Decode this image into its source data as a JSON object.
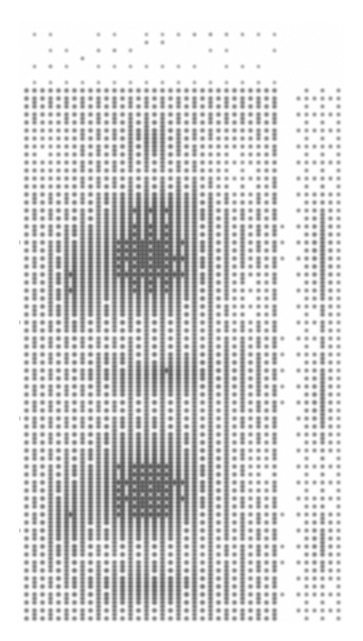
{
  "document": {
    "kind": "dithered-halftone-scan",
    "title": "Dithered halftone scan",
    "caption": "Coarse ordered-dither reproduction of a scanned grayscale image",
    "width": 363,
    "height": 641,
    "background_color": "#ffffff",
    "ink_color": "#6e6e6e",
    "ink_color_light": "#9a9a9a"
  },
  "render": {
    "dither_type": "ordered-diagonal",
    "cell_size": 4,
    "blur_radius": 1.15,
    "ink_min_gray": 96,
    "ink_max_gray": 178,
    "paper_gray": 255,
    "noise_amount": 0.035
  },
  "margins": {
    "left": 20,
    "right": 20,
    "top": 25,
    "bottom": 19
  },
  "regions": [
    {
      "name": "main-block",
      "x": 20,
      "y": 85,
      "width": 262,
      "height": 537,
      "base_tone": 0.34,
      "note": "large left/main textured panel"
    },
    {
      "name": "gutter-column",
      "x": 282,
      "y": 85,
      "width": 10,
      "height": 537,
      "base_tone": 0.02,
      "note": "near-white vertical separator"
    },
    {
      "name": "right-column",
      "x": 292,
      "y": 85,
      "width": 51,
      "height": 537,
      "base_tone": 0.2,
      "note": "narrower lighter right panel"
    },
    {
      "name": "top-arc-band",
      "x": 20,
      "y": 25,
      "width": 260,
      "height": 60,
      "base_tone": 0.06,
      "note": "sparse rising arc of dashes over white"
    }
  ],
  "tone_field": {
    "description": "Additive elliptical tone blobs over the region bases. tone 0 = paper white, 1 = solid ink.",
    "blobs": [
      {
        "name": "upper-dark-mass",
        "cx": 150,
        "cy": 265,
        "rx": 108,
        "ry": 92,
        "amp": 0.4,
        "falloff": 1.6
      },
      {
        "name": "upper-core",
        "cx": 145,
        "cy": 250,
        "rx": 70,
        "ry": 58,
        "amp": 0.26,
        "falloff": 1.8
      },
      {
        "name": "upper-crest",
        "cx": 160,
        "cy": 205,
        "rx": 92,
        "ry": 34,
        "amp": 0.22,
        "falloff": 1.5
      },
      {
        "name": "upper-left-edge",
        "cx": 72,
        "cy": 280,
        "rx": 42,
        "ry": 95,
        "amp": 0.22,
        "falloff": 1.7
      },
      {
        "name": "cross-patch-top",
        "cx": 150,
        "cy": 140,
        "rx": 52,
        "ry": 38,
        "amp": 0.2,
        "falloff": 1.9
      },
      {
        "name": "mid-band",
        "cx": 162,
        "cy": 372,
        "rx": 120,
        "ry": 40,
        "amp": 0.3,
        "falloff": 1.5
      },
      {
        "name": "lower-dark-mass",
        "cx": 150,
        "cy": 480,
        "rx": 110,
        "ry": 98,
        "amp": 0.38,
        "falloff": 1.6
      },
      {
        "name": "lower-core",
        "cx": 140,
        "cy": 500,
        "rx": 72,
        "ry": 62,
        "amp": 0.24,
        "falloff": 1.8
      },
      {
        "name": "lower-left-edge",
        "cx": 66,
        "cy": 520,
        "rx": 40,
        "ry": 80,
        "amp": 0.24,
        "falloff": 1.7
      },
      {
        "name": "bottom-sweep",
        "cx": 150,
        "cy": 585,
        "rx": 118,
        "ry": 34,
        "amp": 0.26,
        "falloff": 1.5
      },
      {
        "name": "right-col-upper",
        "cx": 318,
        "cy": 250,
        "rx": 26,
        "ry": 95,
        "amp": 0.26,
        "falloff": 1.6
      },
      {
        "name": "right-col-mid",
        "cx": 316,
        "cy": 400,
        "rx": 24,
        "ry": 80,
        "amp": 0.22,
        "falloff": 1.6
      },
      {
        "name": "right-col-lower",
        "cx": 318,
        "cy": 545,
        "rx": 26,
        "ry": 70,
        "amp": 0.22,
        "falloff": 1.6
      },
      {
        "name": "right-col-spine",
        "cx": 324,
        "cy": 350,
        "rx": 9,
        "ry": 240,
        "amp": 0.16,
        "falloff": 1.4
      }
    ],
    "voids": [
      {
        "name": "upper-right-light",
        "cx": 238,
        "cy": 170,
        "rx": 54,
        "ry": 62,
        "amp": 0.18,
        "falloff": 1.6
      },
      {
        "name": "mid-right-light",
        "cx": 250,
        "cy": 300,
        "rx": 44,
        "ry": 58,
        "amp": 0.14,
        "falloff": 1.6
      },
      {
        "name": "upper-left-light",
        "cx": 46,
        "cy": 150,
        "rx": 40,
        "ry": 58,
        "amp": 0.14,
        "falloff": 1.6
      },
      {
        "name": "seam-light",
        "cx": 150,
        "cy": 360,
        "rx": 58,
        "ry": 16,
        "amp": 0.1,
        "falloff": 1.5
      },
      {
        "name": "lower-right-light",
        "cx": 258,
        "cy": 470,
        "rx": 38,
        "ry": 64,
        "amp": 0.12,
        "falloff": 1.6
      }
    ],
    "arc": {
      "name": "top-rising-arc",
      "points": [
        {
          "x": 24,
          "y": 72
        },
        {
          "x": 60,
          "y": 62
        },
        {
          "x": 100,
          "y": 52
        },
        {
          "x": 140,
          "y": 44
        },
        {
          "x": 180,
          "y": 37
        },
        {
          "x": 220,
          "y": 32
        },
        {
          "x": 255,
          "y": 29
        },
        {
          "x": 278,
          "y": 28
        }
      ],
      "thickness": 11,
      "amp": 0.26
    },
    "secondary_arc": {
      "name": "top-inner-arc",
      "points": [
        {
          "x": 205,
          "y": 78
        },
        {
          "x": 240,
          "y": 74
        },
        {
          "x": 270,
          "y": 71
        },
        {
          "x": 290,
          "y": 70
        }
      ],
      "thickness": 8,
      "amp": 0.16
    },
    "vertical_striations": {
      "description": "faint vertical ruled streaks inside the main block",
      "amp": 0.07,
      "period": 17,
      "y_start": 180,
      "y_end": 600
    },
    "diagonal_striations": {
      "description": "dominant 45-degree dither grain",
      "amp": 0.05,
      "period": 8
    }
  },
  "accessibility": {
    "alt": "A tall narrow dithered halftone scan. Coarse 45-degree dot patterns form a large textured panel with two dark rounded masses stacked vertically, a thin near-white vertical gutter near the right, a narrower lighter column beyond it, and a sparse arc of rising dashes across the top white margin."
  }
}
